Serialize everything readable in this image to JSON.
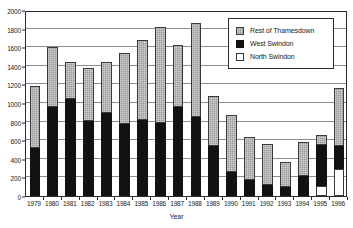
{
  "chart_data": {
    "type": "bar",
    "subtype": "stacked-vertical",
    "title": "",
    "xlabel": "Year",
    "ylabel": "",
    "ylim": [
      0,
      2000
    ],
    "ytick_step": 200,
    "yticks": [
      0,
      200,
      400,
      600,
      800,
      1000,
      1200,
      1400,
      1600,
      1800,
      2000
    ],
    "grid": "horizontal",
    "legend_position": "top-right",
    "categories": [
      "1979",
      "1980",
      "1981",
      "1982",
      "1983",
      "1984",
      "1985",
      "1986",
      "1987",
      "1988",
      "1989",
      "1990",
      "1991",
      "1992",
      "1993",
      "1994",
      "1995",
      "1996"
    ],
    "series": [
      {
        "name": "North Swindon",
        "color": "#ffffff",
        "stack_order": 0,
        "values": [
          0,
          0,
          0,
          0,
          0,
          0,
          0,
          0,
          0,
          0,
          0,
          0,
          0,
          0,
          0,
          0,
          105,
          290
        ]
      },
      {
        "name": "West Swindon",
        "color": "#121212",
        "stack_order": 1,
        "values": [
          520,
          960,
          1040,
          810,
          895,
          775,
          815,
          780,
          955,
          855,
          540,
          255,
          175,
          115,
          100,
          215,
          440,
          250
        ]
      },
      {
        "name": "Rest of Thamesdown",
        "color": "#9a9a9a",
        "stack_order": 2,
        "values": [
          660,
          640,
          400,
          570,
          545,
          765,
          865,
          1040,
          665,
          1005,
          535,
          620,
          465,
          445,
          270,
          365,
          110,
          620
        ]
      }
    ],
    "totals": [
      1180,
      1600,
      1440,
      1380,
      1440,
      1540,
      1680,
      1820,
      1620,
      1860,
      1075,
      875,
      640,
      560,
      370,
      580,
      655,
      1160
    ]
  },
  "legend": {
    "items": [
      {
        "label": "Rest of Thamesdown",
        "swatch": "gray-textured-swatch"
      },
      {
        "label": "West Swindon",
        "swatch": "black-swatch"
      },
      {
        "label": "North Swindon",
        "swatch": "white-swatch"
      }
    ]
  },
  "axis": {
    "x_title": "Year"
  }
}
